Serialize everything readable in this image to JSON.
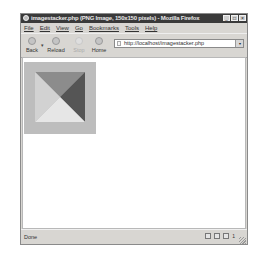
{
  "window": {
    "title": "imagestacker.php (PNG Image, 150x150 pixels) - Mozilla Firefox",
    "controls": [
      "minimize",
      "maximize",
      "close"
    ]
  },
  "menubar": {
    "items": [
      "File",
      "Edit",
      "View",
      "Go",
      "Bookmarks",
      "Tools",
      "Help"
    ]
  },
  "toolbar": {
    "back_label": "Back",
    "reload_label": "Reload",
    "stop_label": "Stop",
    "home_label": "Home",
    "url": "http://localhost/imagestacker.php"
  },
  "content": {
    "image": {
      "width": 150,
      "height": 150,
      "background_color": "#bdbdbd",
      "triangles": {
        "top": "#8c8c8c",
        "right": "#555555",
        "bottom": "#e6e6e6",
        "left": "#d2d2d2"
      }
    }
  },
  "statusbar": {
    "status_text": "Done",
    "count": "1"
  },
  "icons": {
    "minimize": "_",
    "maximize": "□",
    "close": "×",
    "dropdown": "▾"
  }
}
